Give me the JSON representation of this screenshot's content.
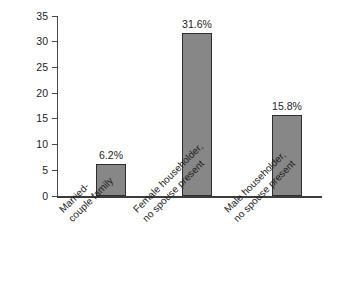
{
  "chart_data": {
    "type": "bar",
    "title": "",
    "subtitle": "",
    "xlabel": "",
    "ylabel": "Percentage",
    "ylim": [
      0,
      35
    ],
    "ytick_step": 5,
    "yticks": [
      "35",
      "30",
      "25",
      "20",
      "15",
      "10",
      "5",
      "0"
    ],
    "grid": false,
    "legend": false,
    "categories": [
      "Married-couple family",
      "Female householder, no spouse present",
      "Male householder, no spouse present"
    ],
    "category_lines": [
      [
        "Married-",
        "couple family"
      ],
      [
        "Female householder,",
        "no spouse present"
      ],
      [
        "Male householder,",
        "no spouse present"
      ]
    ],
    "values": [
      6.2,
      31.6,
      15.8
    ],
    "value_labels": [
      "6.2%",
      "31.6%",
      "15.8%"
    ],
    "colors": {
      "bar_fill": "#878787",
      "bar_edge": "#2e2e2e",
      "axis": "#4a4a4a",
      "baseline": "#3c3c3c",
      "text": "#1d1d1d",
      "background": "#ffffff"
    }
  }
}
